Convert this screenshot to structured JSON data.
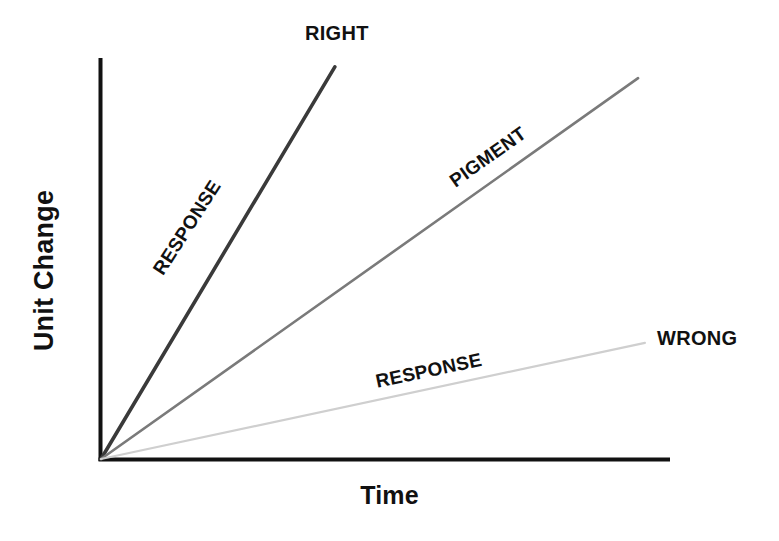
{
  "chart_data": {
    "type": "line",
    "title": "",
    "subtitle": "",
    "xlabel": "Time",
    "ylabel": "Unit Change",
    "grid": false,
    "legend_position": "inline-annotations",
    "axis_only": true,
    "xlim": [
      0,
      100
    ],
    "ylim": [
      0,
      100
    ],
    "x_tick_labels": [],
    "y_tick_labels": [],
    "series": [
      {
        "name": "RESPONSE",
        "endpoint_label": "RIGHT",
        "inline_label": "RESPONSE",
        "color": "#3a3a3a",
        "width_px": 3.6,
        "slope_units_per_time": 4.13,
        "x": [
          0,
          41.2
        ],
        "values": [
          0,
          97.8
        ],
        "angle_deg": -57.2
      },
      {
        "name": "PIGMENT",
        "endpoint_label": "",
        "inline_label": "PIGMENT",
        "color": "#7a7a7a",
        "width_px": 2.6,
        "slope_units_per_time": 1.73,
        "x": [
          0,
          94.4
        ],
        "values": [
          0,
          95.0
        ],
        "angle_deg": -35.5
      },
      {
        "name": "RESPONSE",
        "endpoint_label": "WRONG",
        "inline_label": "RESPONSE",
        "color": "#cfcfcf",
        "width_px": 2.2,
        "slope_units_per_time": 0.56,
        "x": [
          0,
          95.6
        ],
        "values": [
          0,
          29.3
        ],
        "angle_deg": -11.9
      }
    ],
    "annotations": [
      {
        "text": "RIGHT",
        "kind": "series-endpoint"
      },
      {
        "text": "RESPONSE",
        "kind": "series-inline"
      },
      {
        "text": "PIGMENT",
        "kind": "series-inline"
      },
      {
        "text": "RESPONSE",
        "kind": "series-inline"
      },
      {
        "text": "WRONG",
        "kind": "series-endpoint"
      }
    ],
    "axes": {
      "origin_px": [
        100,
        461
      ],
      "y_axis_top_px": [
        100,
        58
      ],
      "x_axis_right_px": [
        670,
        461
      ],
      "color": "#111111",
      "width_px": 4
    }
  },
  "labels": {
    "right": "RIGHT",
    "wrong": "WRONG",
    "pigment": "PIGMENT",
    "response_steep": "RESPONSE",
    "response_shallow": "RESPONSE",
    "y_axis": "Unit Change",
    "x_axis": "Time"
  },
  "colors": {
    "axis": "#111111",
    "text": "#111111",
    "series_right": "#3a3a3a",
    "series_pigment": "#7a7a7a",
    "series_wrong": "#cfcfcf",
    "background": "#ffffff"
  }
}
